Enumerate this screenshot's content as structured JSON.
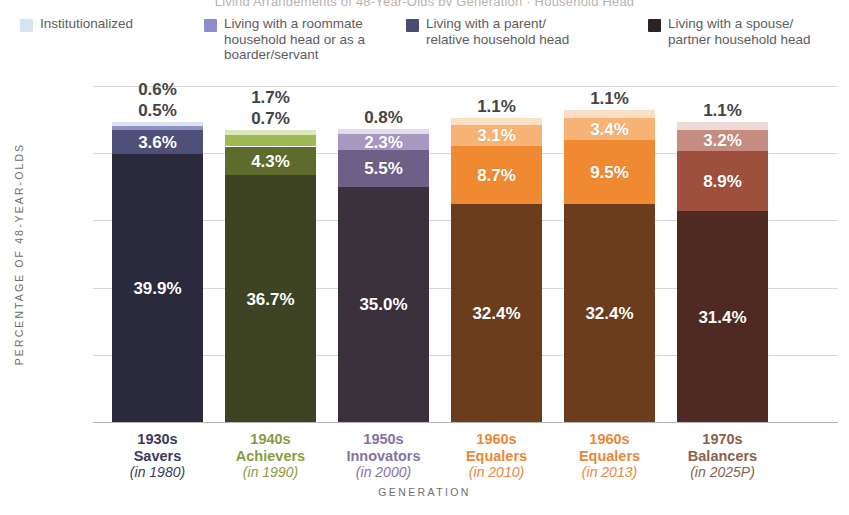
{
  "title_cutoff": "Living Arrangements of 48-Year-Olds by Generation · Household Head",
  "legend": {
    "items": [
      {
        "label": "Institutionalized",
        "color": "#d6e3f0",
        "name": "legend-institutionalized"
      },
      {
        "label": "Living with a roommate\nhousehold head or as a\nboarder/servant",
        "color": "#8d8ecb",
        "name": "legend-roommate"
      },
      {
        "label": "Living with a parent/\nrelative household head",
        "color": "#4a4a74",
        "name": "legend-parent"
      },
      {
        "label": "Living with a spouse/\npartner household head",
        "color": "#2b2422",
        "name": "legend-spouse"
      }
    ]
  },
  "axes": {
    "y_title": "PERCENTAGE OF 48-YEAR-OLDS",
    "x_title": "GENERATION",
    "y_ticks": [
      "50%",
      "40%",
      "30%",
      "20%",
      "10%",
      "0%"
    ]
  },
  "chart_data": {
    "type": "bar",
    "subtype": "stacked-bar",
    "title": "Living Arrangements of 48-Year-Olds by Generation",
    "xlabel": "GENERATION",
    "ylabel": "PERCENTAGE OF 48-YEAR-OLDS",
    "ylim": [
      0,
      50
    ],
    "yticks": [
      0,
      10,
      20,
      30,
      40,
      50
    ],
    "ytick_labels": [
      "0%",
      "10%",
      "20%",
      "30%",
      "40%",
      "50%"
    ],
    "grid": true,
    "legend_position": "top",
    "categories": [
      "1930s Savers (in 1980)",
      "1940s Achievers (in 1990)",
      "1950s Innovators (in 2000)",
      "1960s Equalers (in 2010)",
      "1960s Equalers (in 2013)",
      "1970s Balancers (in 2025P)"
    ],
    "series": [
      {
        "name": "Living with a spouse/partner household head",
        "values": [
          39.9,
          36.7,
          35.0,
          32.4,
          32.4,
          31.4
        ]
      },
      {
        "name": "Living with a parent/relative household head",
        "values": [
          3.6,
          4.3,
          5.5,
          8.7,
          9.5,
          8.9
        ]
      },
      {
        "name": "Living with a roommate household head or as a boarder/servant",
        "values": [
          0.6,
          1.7,
          2.3,
          3.1,
          3.4,
          3.2
        ]
      },
      {
        "name": "Institutionalized",
        "values": [
          0.5,
          0.7,
          0.8,
          1.1,
          1.1,
          1.1
        ]
      }
    ],
    "totals": [
      44.6,
      43.4,
      43.6,
      45.3,
      46.4,
      44.6
    ]
  },
  "bars": [
    {
      "name": "bar-1930s-savers",
      "cat_line1": "1930s",
      "cat_line2": "Savers",
      "cat_year": "(in 1980)",
      "cat_color": "#3b3a5c",
      "segments": [
        {
          "label": "39.9%",
          "value": 39.9,
          "color": "#2b2a3c",
          "inside": true,
          "name": "segment-spouse"
        },
        {
          "label": "3.6%",
          "value": 3.6,
          "color": "#4f5079",
          "inside": true,
          "name": "segment-parent"
        },
        {
          "label": "0.6%",
          "value": 0.6,
          "color": "#8e90c4",
          "inside": false,
          "name": "segment-roommate"
        },
        {
          "label": "0.5%",
          "value": 0.5,
          "color": "#d9e4f2",
          "inside": false,
          "name": "segment-institutionalized"
        }
      ]
    },
    {
      "name": "bar-1940s-achievers",
      "cat_line1": "1940s",
      "cat_line2": "Achievers",
      "cat_year": "(in 1990)",
      "cat_color": "#8a9c3f",
      "segments": [
        {
          "label": "36.7%",
          "value": 36.7,
          "color": "#3e4423",
          "inside": true,
          "name": "segment-spouse"
        },
        {
          "label": "4.3%",
          "value": 4.3,
          "color": "#5e6b2c",
          "inside": true,
          "name": "segment-parent"
        },
        {
          "label": "1.7%",
          "value": 1.7,
          "color": "#9dba55",
          "inside": false,
          "name": "segment-roommate"
        },
        {
          "label": "0.7%",
          "value": 0.7,
          "color": "#dbe8bd",
          "inside": false,
          "name": "segment-institutionalized"
        }
      ]
    },
    {
      "name": "bar-1950s-innovators",
      "cat_line1": "1950s",
      "cat_line2": "Innovators",
      "cat_year": "(in 2000)",
      "cat_color": "#8673a0",
      "segments": [
        {
          "label": "35.0%",
          "value": 35.0,
          "color": "#3b313c",
          "inside": true,
          "name": "segment-spouse"
        },
        {
          "label": "5.5%",
          "value": 5.5,
          "color": "#6e5f87",
          "inside": true,
          "name": "segment-parent"
        },
        {
          "label": "2.3%",
          "value": 2.3,
          "color": "#a898c1",
          "inside": true,
          "name": "segment-roommate"
        },
        {
          "label": "0.8%",
          "value": 0.8,
          "color": "#e2dcec",
          "inside": false,
          "name": "segment-institutionalized"
        }
      ]
    },
    {
      "name": "bar-1960s-equalers-2010",
      "cat_line1": "1960s",
      "cat_line2": "Equalers",
      "cat_year": "(in 2010)",
      "cat_color": "#e8883a",
      "segments": [
        {
          "label": "32.4%",
          "value": 32.4,
          "color": "#6b3d1d",
          "inside": true,
          "name": "segment-spouse"
        },
        {
          "label": "8.7%",
          "value": 8.7,
          "color": "#ef8a33",
          "inside": true,
          "name": "segment-parent"
        },
        {
          "label": "3.1%",
          "value": 3.1,
          "color": "#f6b375",
          "inside": true,
          "name": "segment-roommate"
        },
        {
          "label": "1.1%",
          "value": 1.1,
          "color": "#fbe0c6",
          "inside": false,
          "name": "segment-institutionalized"
        }
      ]
    },
    {
      "name": "bar-1960s-equalers-2013",
      "cat_line1": "1960s",
      "cat_line2": "Equalers",
      "cat_year": "(in 2013)",
      "cat_color": "#e8883a",
      "segments": [
        {
          "label": "32.4%",
          "value": 32.4,
          "color": "#6b3d1d",
          "inside": true,
          "name": "segment-spouse"
        },
        {
          "label": "9.5%",
          "value": 9.5,
          "color": "#ef8a33",
          "inside": true,
          "name": "segment-parent"
        },
        {
          "label": "3.4%",
          "value": 3.4,
          "color": "#f6b375",
          "inside": true,
          "name": "segment-roommate"
        },
        {
          "label": "1.1%",
          "value": 1.1,
          "color": "#fbe0c6",
          "inside": false,
          "name": "segment-institutionalized"
        }
      ]
    },
    {
      "name": "bar-1970s-balancers",
      "cat_line1": "1970s",
      "cat_line2": "Balancers",
      "cat_year": "(in 2025P)",
      "cat_color": "#8a5f4e",
      "segments": [
        {
          "label": "31.4%",
          "value": 31.4,
          "color": "#4f2a22",
          "inside": true,
          "name": "segment-spouse"
        },
        {
          "label": "8.9%",
          "value": 8.9,
          "color": "#9e4f3e",
          "inside": true,
          "name": "segment-parent"
        },
        {
          "label": "3.2%",
          "value": 3.2,
          "color": "#c58d81",
          "inside": true,
          "name": "segment-roommate"
        },
        {
          "label": "1.1%",
          "value": 1.1,
          "color": "#eddad5",
          "inside": false,
          "name": "segment-institutionalized"
        }
      ]
    }
  ]
}
